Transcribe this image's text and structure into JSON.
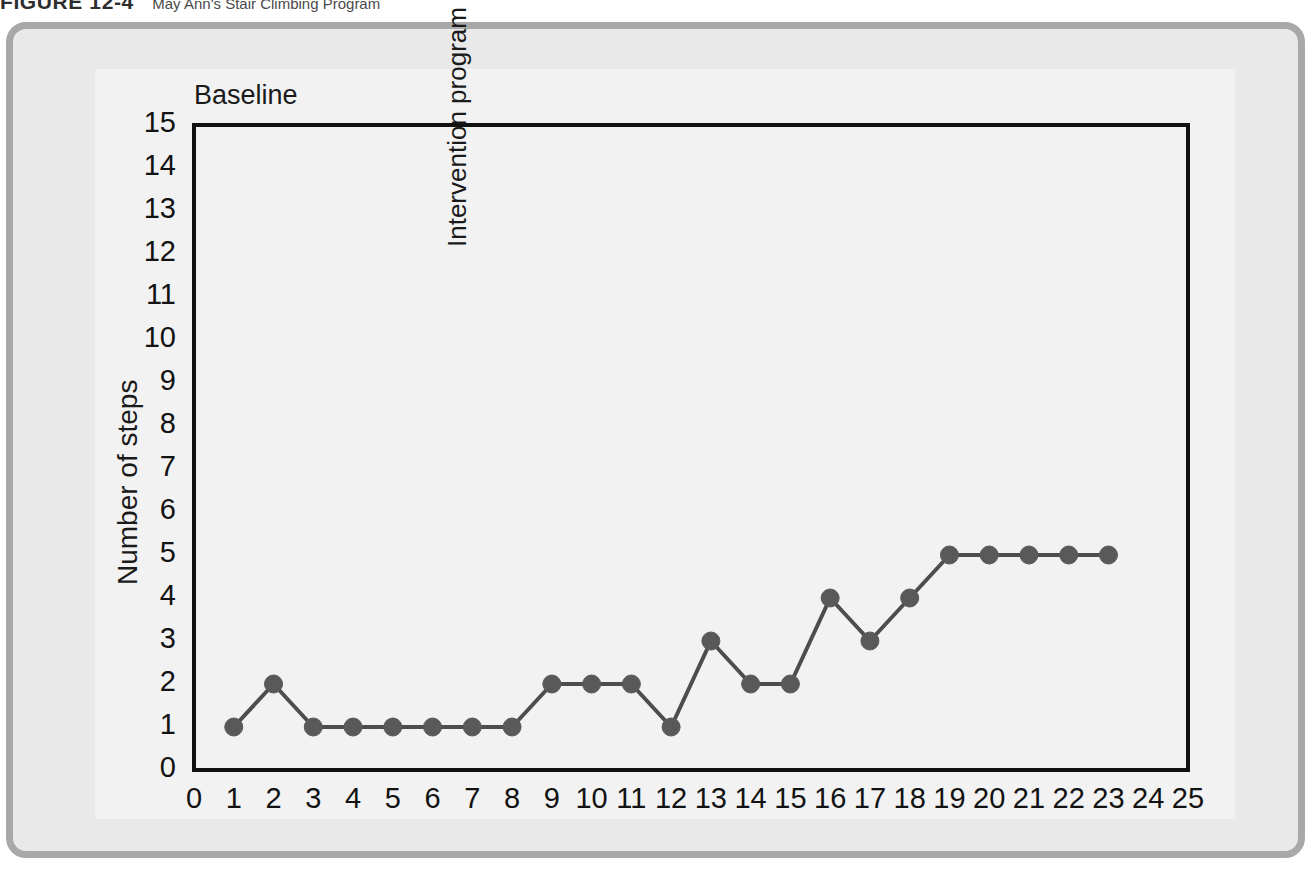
{
  "figure": {
    "label": "FIGURE 12-4",
    "title": "May Ann's Stair Climbing Program"
  },
  "colors": {
    "card_border": "#a8a8a8",
    "card_background": "#e9e9e9",
    "inner_panel": "#f2f2f2",
    "axis": "#111111",
    "line": "#4d4d4d",
    "marker": "#595959",
    "text": "#1a1a1a"
  },
  "chart_data": {
    "type": "line",
    "title": "May Ann's Stair Climbing Program",
    "xlabel": "",
    "ylabel": "Number of steps",
    "xlim": [
      0,
      25
    ],
    "ylim": [
      0,
      15
    ],
    "grid": false,
    "legend": "none",
    "x_ticks": [
      0,
      1,
      2,
      3,
      4,
      5,
      6,
      7,
      8,
      9,
      10,
      11,
      12,
      13,
      14,
      15,
      16,
      17,
      18,
      19,
      20,
      21,
      22,
      23,
      24,
      25
    ],
    "y_ticks": [
      0,
      1,
      2,
      3,
      4,
      5,
      6,
      7,
      8,
      9,
      10,
      11,
      12,
      13,
      14,
      15
    ],
    "x": [
      1,
      2,
      3,
      4,
      5,
      6,
      7,
      8,
      9,
      10,
      11,
      12,
      13,
      14,
      15,
      16,
      17,
      18,
      19,
      20,
      21,
      22,
      23
    ],
    "values": [
      1,
      2,
      1,
      1,
      1,
      1,
      1,
      1,
      2,
      2,
      2,
      1,
      3,
      2,
      2,
      4,
      3,
      4,
      5,
      5,
      5,
      5,
      5
    ],
    "series": [
      {
        "name": "Number of steps",
        "x": [
          1,
          2,
          3,
          4,
          5,
          6,
          7,
          8,
          9,
          10,
          11,
          12,
          13,
          14,
          15,
          16,
          17,
          18,
          19,
          20,
          21,
          22,
          23
        ],
        "values": [
          1,
          2,
          1,
          1,
          1,
          1,
          1,
          1,
          2,
          2,
          2,
          1,
          3,
          2,
          2,
          4,
          3,
          4,
          5,
          5,
          5,
          5,
          5
        ]
      }
    ],
    "annotations": [
      {
        "name": "baseline",
        "text": "Baseline",
        "x": 1,
        "y": 15,
        "orientation": "horizontal"
      },
      {
        "name": "phase-divider",
        "text": "Intervention program begins",
        "x": 8.5,
        "y": 0,
        "orientation": "vertical"
      }
    ]
  }
}
